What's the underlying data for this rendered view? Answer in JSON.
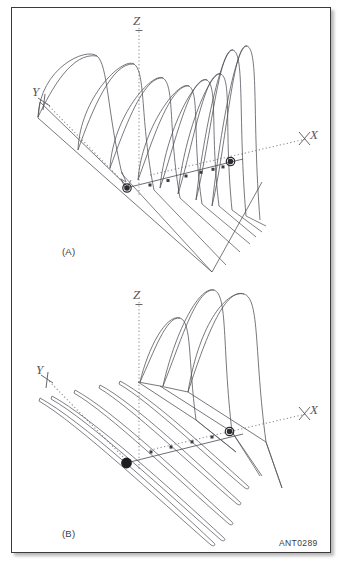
{
  "figure": {
    "id_label": "ANT0289",
    "panels": [
      {
        "key": "A",
        "label": "(A)",
        "caption_text": "(A)"
      },
      {
        "key": "B",
        "label": "(B)",
        "caption_text": "(B)"
      }
    ]
  },
  "axes": {
    "z_label": "Z",
    "x_label": "X",
    "y_label": "Y"
  },
  "panel_a": {
    "axis_z_label": "Z",
    "axis_x_label": "X",
    "axis_y_label": "Y",
    "lobe_count": 8,
    "marker_square_count": 6,
    "marker_ring_count": 2
  },
  "panel_b": {
    "axis_z_label": "Z",
    "axis_x_label": "X",
    "axis_y_label": "Y",
    "lobe_count": 3,
    "sliver_count": 5,
    "marker_square_count": 4,
    "marker_ring_count": 1,
    "marker_filled_count": 1
  },
  "colors": {
    "frame_border": "#3a3a3a",
    "curve_stroke": "#4b4b52",
    "axis_dotted": "#8a8a90",
    "marker_dark": "#2b2b31",
    "background": "#ffffff"
  }
}
